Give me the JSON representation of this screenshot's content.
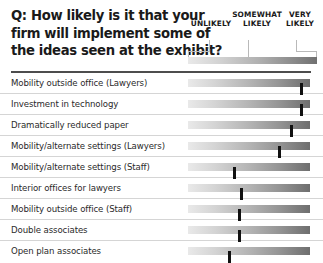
{
  "title": {
    "lines": [
      "Q: How likely is it that your",
      "firm will implement some of",
      "the ideas seen at the exhibit?"
    ]
  },
  "scale": {
    "labels": [
      {
        "id": "unlikely",
        "text": "UNLIKELY"
      },
      {
        "id": "somewhat-likely",
        "line1": "SOMEWHAT",
        "line2": "LIKELY"
      },
      {
        "id": "very-likely",
        "line1": "VERY",
        "line2": "LIKELY"
      }
    ],
    "gradient_from": "#e9e9e9",
    "gradient_to": "#707070"
  },
  "colors": {
    "marker": "#111111",
    "rule": "#4d4d4d",
    "separator": "#d5d5d5",
    "text": "#2a2a2a",
    "title_text": "#1a1a1a",
    "tick": "#b9b9b9"
  },
  "chart_data": {
    "type": "bar",
    "title": "Q: How likely is it that your firm will implement some of the ideas seen at the exhibit?",
    "xlabel": "",
    "ylabel": "",
    "scale_ticks": [
      "UNLIKELY",
      "SOMEWHAT LIKELY",
      "VERY LIKELY"
    ],
    "xlim": [
      0,
      100
    ],
    "grid": false,
    "legend": "none",
    "note": "Each row shows a single marker position along a continuous UNLIKELY-to-VERY LIKELY gradient scale; value is the marker's percent position along the track.",
    "categories": [
      "Mobility outside office (Lawyers)",
      "Investment in technology",
      "Dramatically reduced paper",
      "Mobility/alternate settings (Lawyers)",
      "Mobility/alternate settings (Staff)",
      "Interior offices for lawyers",
      "Mobility outside office (Staff)",
      "Double associates",
      "Open plan associates"
    ],
    "values": [
      93,
      93,
      85,
      75,
      38,
      44,
      42,
      42,
      34
    ]
  },
  "rows": [
    {
      "label": "Mobility outside office (Lawyers)",
      "value": 93
    },
    {
      "label": "Investment in technology",
      "value": 93
    },
    {
      "label": "Dramatically reduced paper",
      "value": 85
    },
    {
      "label": "Mobility/alternate settings (Lawyers)",
      "value": 75
    },
    {
      "label": "Mobility/alternate settings (Staff)",
      "value": 38
    },
    {
      "label": "Interior offices for lawyers",
      "value": 44
    },
    {
      "label": "Mobility outside office (Staff)",
      "value": 42
    },
    {
      "label": "Double associates",
      "value": 42
    },
    {
      "label": "Open plan associates",
      "value": 34
    }
  ]
}
